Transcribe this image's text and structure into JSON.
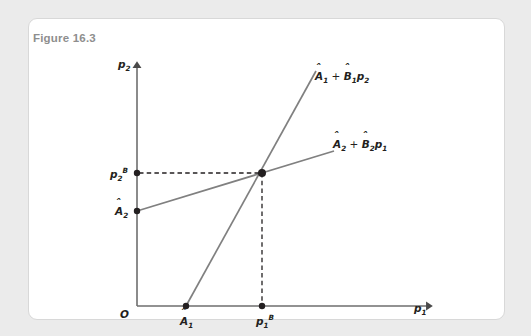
{
  "figure": {
    "title": "Figure 16.3",
    "background_color": "#ebebeb",
    "card_color": "#ffffff",
    "card_border_color": "#d8d8d8",
    "title_color": "#8e8e8e"
  },
  "axes": {
    "y_label": "p",
    "y_label_sub": "2",
    "x_label": "p",
    "x_label_sub": "1",
    "origin_label": "O",
    "axis_color": "#6e6e6e"
  },
  "curves": [
    {
      "name": "best-response-firm-1",
      "label_base": "A",
      "label_hat": "̂",
      "label_sub1": "1",
      "label_plus": " + ",
      "label_b": "B",
      "label_sub2": "1",
      "label_var": "p",
      "label_var_sub": "2",
      "label_text": "Â₁ + B̂1p₂",
      "color": "#808080",
      "description": "steep upward sloping line from x-intercept A-hat-1"
    },
    {
      "name": "best-response-firm-2",
      "label_base": "A",
      "label_hat": "̂",
      "label_sub1": "2",
      "label_plus": " + ",
      "label_b": "B",
      "label_sub2": "2",
      "label_var": "p",
      "label_var_sub": "1",
      "label_text": "Â₂ + B̂2p₁",
      "color": "#808080",
      "description": "shallow upward sloping line from y-intercept A-hat-2"
    }
  ],
  "points": [
    {
      "name": "y-intercept-a2",
      "label_base": "A",
      "label_sub": "2",
      "label_sup": "",
      "x": 137,
      "y": 211
    },
    {
      "name": "equilibrium-p2",
      "label_base": "p",
      "label_sub": "2",
      "label_sup": "B",
      "x": 137,
      "y": 173
    },
    {
      "name": "x-intercept-a1",
      "label_base": "A",
      "label_sub": "1",
      "label_sup": "",
      "x": 186,
      "y": 306
    },
    {
      "name": "equilibrium-p1",
      "label_base": "p",
      "label_sub": "1",
      "label_sup": "B",
      "x": 262,
      "y": 306
    },
    {
      "name": "equilibrium-intersection",
      "label_base": "",
      "label_sub": "",
      "label_sup": "",
      "x": 262,
      "y": 173
    }
  ],
  "dashed_lines": {
    "color": "#231f20",
    "horizontal_from_x": 137,
    "horizontal_to_x": 262,
    "horizontal_y": 173,
    "vertical_x": 262,
    "vertical_from_y": 173,
    "vertical_to_y": 306
  }
}
